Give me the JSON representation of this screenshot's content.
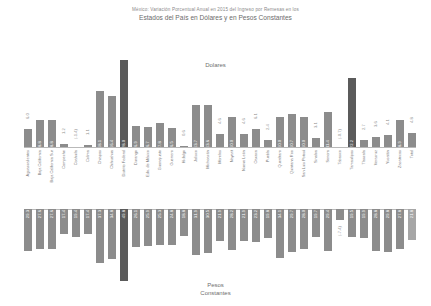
{
  "title": {
    "line1": "México: Variación Porcentual Anual en 2015 del Ingreso por Remesas en los",
    "line2": "Estados del País en Dólares y en Pesos Constantes"
  },
  "legends": {
    "upper": "Dolares",
    "lower_line1": "Pesos",
    "lower_line2": "Constantes"
  },
  "colors": {
    "bar": "#8c8c8c",
    "bar_highlight": "#5b5b5b",
    "bar_light": "#a6a6a6",
    "axis": "#b9b9b9",
    "text": "#7c7c7c"
  },
  "chart_data": {
    "type": "bar",
    "title": "México: Variación Porcentual Anual en 2015 del Ingreso por Remesas en los Estados del País en Dólares y en Pesos Constantes",
    "xlabel": "",
    "ylabel": "",
    "grid": false,
    "legend_position": "inside",
    "categories": [
      "Aguascalientes",
      "Baja California",
      "Baja California Sur",
      "Campeche",
      "Coahuila",
      "Colima",
      "Chiapas",
      "Chihuahua",
      "Distrito Federal",
      "Durango",
      "Edo. de México",
      "Guanajuato",
      "Guerrero",
      "Hidalgo",
      "Jalisco",
      "Michoacán",
      "Morelos",
      "Nayarit",
      "Nuevo León",
      "Oaxaca",
      "Puebla",
      "Querétaro",
      "Quintana Roo",
      "San Luis Potosí",
      "Sinaloa",
      "Sonora",
      "Tabasco",
      "Tamaulipas",
      "Tlaxcala",
      "Veracruz",
      "Yucatán",
      "Zacatecas",
      "Total"
    ],
    "series": [
      {
        "name": "Dolares",
        "values": [
          6.0,
          8.8,
          8.8,
          1.2,
          -1.4,
          1.1,
          18.1,
          16.4,
          28.0,
          6.9,
          6.7,
          7.8,
          6.5,
          0.6,
          13.7,
          13.6,
          4.6,
          10.0,
          4.6,
          6.1,
          2.4,
          10.0,
          10.7,
          10.0,
          3.1,
          11.4,
          -0.7,
          22.2,
          2.7,
          3.6,
          4.1,
          8.9,
          4.8
        ],
        "labels": [
          "6.0",
          "8.8",
          "8.8",
          "1.2",
          "(-1.4)",
          "1.1",
          "18.1",
          "16.4",
          "28.0",
          "6.9",
          "6.7",
          "7.8",
          "6.5",
          "0.6",
          "13.7",
          "13.6",
          "4.6",
          "10.0",
          "4.6",
          "6.1",
          "2.4",
          "10.0",
          "10.7",
          "10.0",
          "3.1",
          "11.4",
          "(-0.7)",
          "22.2",
          "2.7",
          "3.6",
          "4.1",
          "8.9",
          "4.8"
        ],
        "ylim": [
          -2,
          30
        ]
      },
      {
        "name": "Pesos Constantes",
        "values": [
          -29.3,
          -27.6,
          -27.6,
          -17.4,
          -19.4,
          -17.4,
          -37.3,
          -34.8,
          -49.8,
          -26.1,
          -25.9,
          -25.3,
          -24.8,
          -18.8,
          -31.9,
          -30.5,
          -21.9,
          -28.2,
          -21.9,
          -23.2,
          -19.8,
          -34.1,
          -29.7,
          -28.0,
          -19.7,
          -29.4,
          -7.4,
          -19.5,
          -19.9,
          -28.8,
          -29.8,
          -27.8,
          -21.8
        ],
        "labels": [
          "29.3",
          "27.6",
          "27.6",
          "17.4",
          "19.4",
          "17.4",
          "37.3",
          "34.8",
          "49.8",
          "26.1",
          "25.9",
          "25.3",
          "24.8",
          "18.8",
          "31.9",
          "30.5",
          "21.9",
          "28.2",
          "21.9",
          "23.2",
          "19.8",
          "34.1",
          "29.7",
          "28.0",
          "19.7",
          "29.4",
          "(-7.4)",
          "19.5",
          "19.9",
          "28.8",
          "29.8",
          "27.8",
          "21.8"
        ],
        "ylim": [
          -50,
          0
        ]
      }
    ]
  }
}
